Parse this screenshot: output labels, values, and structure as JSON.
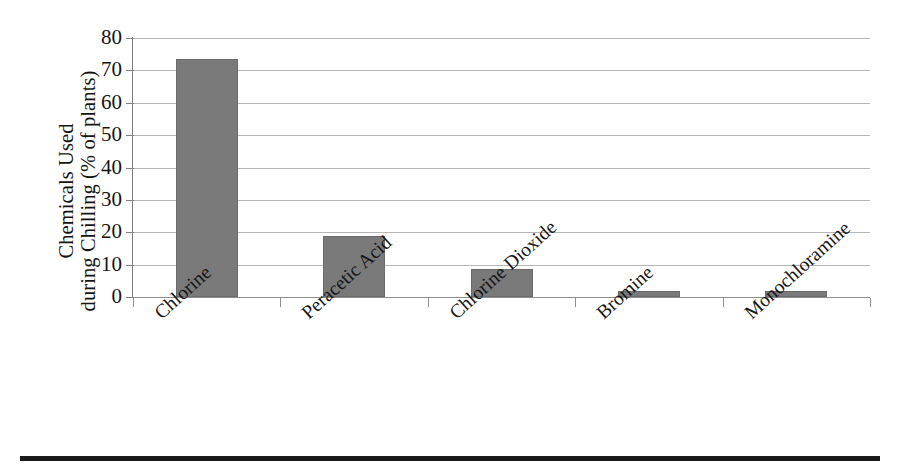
{
  "chart_data": {
    "type": "bar",
    "title": "",
    "subtitle": "",
    "xlabel": "",
    "ylabel": "Chemicals Used during Chilling (% of plants)",
    "ylabel_lines": [
      "Chemicals Used",
      "during Chilling (% of plants)"
    ],
    "categories": [
      "Chlorine",
      "Peracetic Acid",
      "Chlorine Dioxide",
      "Bromine",
      "Monochloramine"
    ],
    "values": [
      73.5,
      19,
      8.5,
      2,
      2
    ],
    "ylim": [
      0,
      80
    ],
    "ytick_values": [
      0,
      10,
      20,
      30,
      40,
      50,
      60,
      70,
      80
    ],
    "ytick_labels": [
      "0",
      "10",
      "20",
      "30",
      "40",
      "50",
      "60",
      "70",
      "80"
    ],
    "grid": "horizontal",
    "legend": "none",
    "bar_color": "#79797a",
    "gridline_color": "#b4b6b8",
    "axis_color": "#7d7f81",
    "background_color": "#ffffff",
    "xtick_label_rotation": -42
  },
  "figure": {
    "bottom_rule_color": "#1b1b1b"
  }
}
